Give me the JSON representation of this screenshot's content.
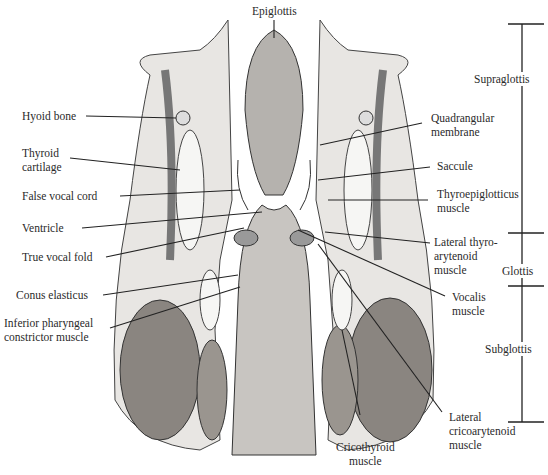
{
  "figure": {
    "top_label": "Epiglottis",
    "left_labels": [
      {
        "text": "Hyoid bone",
        "x": 22,
        "y": 109
      },
      {
        "text": "Thyroid\ncartilage",
        "x": 22,
        "y": 146
      },
      {
        "text": "False vocal cord",
        "x": 22,
        "y": 189
      },
      {
        "text": "Ventricle",
        "x": 22,
        "y": 221
      },
      {
        "text": "True vocal fold",
        "x": 22,
        "y": 250
      },
      {
        "text": "Conus elasticus",
        "x": 16,
        "y": 288
      },
      {
        "text": "Inferior pharyngeal\nconstrictor muscle",
        "x": 4,
        "y": 316
      }
    ],
    "right_labels": [
      {
        "text": "Quadrangular\nmembrane",
        "x": 431,
        "y": 111
      },
      {
        "text": "Saccule",
        "x": 437,
        "y": 159
      },
      {
        "text": "Thyroepiglotticus\nmuscle",
        "x": 437,
        "y": 187
      },
      {
        "text": "Lateral thyro-\narytenoid\nmuscle",
        "x": 434,
        "y": 235
      },
      {
        "text": "Vocalis\nmuscle",
        "x": 452,
        "y": 290
      },
      {
        "text": "Lateral\ncricoarytenoid\nmuscle",
        "x": 449,
        "y": 410
      }
    ],
    "bottom_label": "Cricothyroid\nmuscle",
    "regions": [
      {
        "name": "Supraglottis",
        "label_y": 74
      },
      {
        "name": "Glottis",
        "label_y": 266
      },
      {
        "name": "Subglottis",
        "label_y": 344
      }
    ]
  }
}
